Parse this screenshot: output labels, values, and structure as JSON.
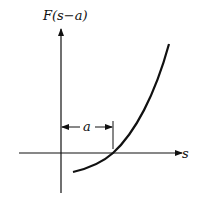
{
  "diagram": {
    "y_axis_label": "F(s−a)",
    "x_axis_label": "s",
    "shift_label": "a",
    "colors": {
      "ink": "#111111",
      "background": "#ffffff"
    }
  }
}
